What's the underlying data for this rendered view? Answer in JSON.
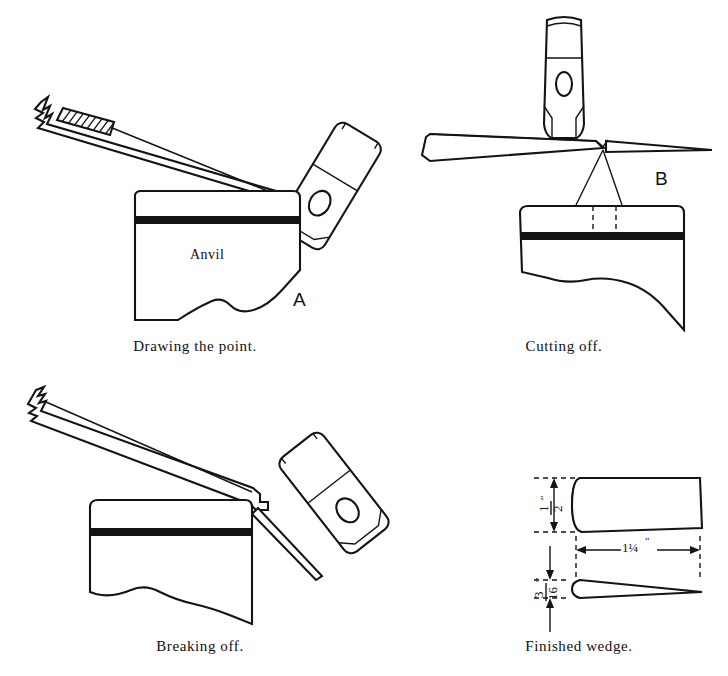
{
  "plate": {
    "title": "Forging a wedge — four-step blacksmithing sequence",
    "background_color": "#ffffff",
    "ink_color": "#141414",
    "width": 728,
    "height": 676
  },
  "figures": [
    {
      "id": "drawing-the-point",
      "caption": "Drawing the point.",
      "letter_label": "A",
      "part_label": "Anvil",
      "position": "top-left",
      "elements": [
        "iron-bar-with-hatched-section",
        "broken-end-zigzag",
        "hammer-head",
        "anvil-block"
      ]
    },
    {
      "id": "cutting-off",
      "caption": "Cutting off.",
      "letter_label": "B",
      "position": "top-right",
      "elements": [
        "iron-bar-tapered",
        "hammer-head-vertical",
        "anvil-block",
        "projection-lines-dashed"
      ]
    },
    {
      "id": "breaking-off",
      "caption": "Breaking off.",
      "position": "bottom-left",
      "elements": [
        "iron-bar-notched",
        "broken-end-zigzag",
        "hammer-head-angled",
        "anvil-block"
      ]
    },
    {
      "id": "finished-wedge",
      "caption": "Finished wedge.",
      "position": "bottom-right",
      "elements": [
        "wedge-top-view",
        "wedge-side-view",
        "dimension-lines"
      ],
      "dimensions": [
        {
          "name": "width",
          "value": "1/2",
          "unit_mark": "″",
          "orientation": "vertical",
          "numerator": "1",
          "denominator": "2"
        },
        {
          "name": "length",
          "value": "1¼",
          "unit_mark": "″",
          "orientation": "horizontal",
          "whole": "1",
          "fraction": "¼"
        },
        {
          "name": "thickness",
          "value": "3/16",
          "unit_mark": "″",
          "orientation": "vertical",
          "numerator": "3",
          "denominator": "16"
        }
      ]
    }
  ],
  "captions": {
    "drawing": "Drawing the point.",
    "cutting": "Cutting off.",
    "breaking": "Breaking off.",
    "wedge": "Finished wedge."
  },
  "labels": {
    "anvil": "Anvil",
    "letter_a": "A",
    "letter_b": "B"
  },
  "dimension_labels": {
    "half_inch_num": "1",
    "half_inch_den": "2",
    "half_inch_mark": "″",
    "length": "1¼",
    "length_mark": "″",
    "three_sixteenth_num": "3",
    "three_sixteenth_den": "16",
    "three_sixteenth_mark": "″"
  }
}
